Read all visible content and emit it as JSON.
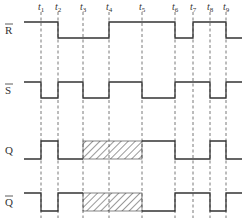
{
  "diagram": {
    "type": "timing-diagram",
    "time_markers": [
      {
        "label": "t",
        "sub": "1",
        "x": 41
      },
      {
        "label": "t",
        "sub": "2",
        "x": 58
      },
      {
        "label": "t",
        "sub": "3",
        "x": 83
      },
      {
        "label": "t",
        "sub": "4",
        "x": 109
      },
      {
        "label": "t",
        "sub": "5",
        "x": 142
      },
      {
        "label": "t",
        "sub": "6",
        "x": 175
      },
      {
        "label": "t",
        "sub": "7",
        "x": 193
      },
      {
        "label": "t",
        "sub": "8",
        "x": 210
      },
      {
        "label": "t",
        "sub": "9",
        "x": 226
      }
    ],
    "signals": [
      {
        "name": "R̄",
        "label": "R",
        "overbar": true,
        "high_y": 22,
        "low_y": 38,
        "points": "24,22 58,22 58,38 109,38 109,22 175,22 175,38 193,38 193,22 226,22 226,38 242,38"
      },
      {
        "name": "S̄",
        "label": "S",
        "overbar": true,
        "high_y": 82,
        "low_y": 98,
        "points": "24,82 41,82 41,98 58,98 58,82 83,82 83,98 109,98 109,82 142,82 142,98 175,98 175,82 210,82 210,98 226,98 226,82 242,82"
      },
      {
        "name": "Q",
        "label": "Q",
        "overbar": false,
        "high_y": 141,
        "low_y": 159,
        "points": "24,159 41,159 41,141 58,141 58,159 83,159",
        "points2": "142,141 175,141 175,159 210,159 210,141 226,141 226,159 242,159",
        "undefined_region": {
          "x1": 83,
          "x2": 142
        }
      },
      {
        "name": "Q̄",
        "label": "Q",
        "overbar": true,
        "high_y": 193,
        "low_y": 211,
        "points": "24,193 41,193 41,211 58,211 58,193 83,193",
        "points2": "142,211 175,211 175,193 210,193 210,211 226,211 226,193 242,193",
        "undefined_region": {
          "x1": 83,
          "x2": 142
        }
      }
    ]
  }
}
